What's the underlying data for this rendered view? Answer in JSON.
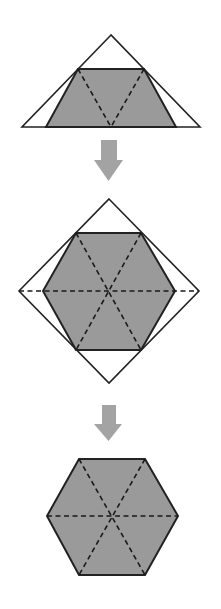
{
  "diagram": {
    "colors": {
      "background": "#ffffff",
      "stroke": "#222222",
      "shade_fill": "#9a9a9a",
      "arrow_fill": "#a3a3a3"
    },
    "steps": [
      {
        "id": "step-1",
        "outer_triangle": [
          [
            111,
            35
          ],
          [
            22,
            127
          ],
          [
            200,
            127
          ]
        ],
        "shaded_trapezoid": [
          [
            78,
            69
          ],
          [
            144,
            69
          ],
          [
            176,
            127
          ],
          [
            46,
            127
          ]
        ],
        "dashed_lines": [
          [
            [
              78,
              69
            ],
            [
              111,
              127
            ]
          ],
          [
            [
              144,
              69
            ],
            [
              111,
              127
            ]
          ]
        ]
      },
      {
        "id": "arrow-1",
        "shaft": [
          101,
          140,
          16,
          21
        ],
        "head": [
          [
            94,
            160
          ],
          [
            123,
            160
          ],
          [
            108.5,
            181
          ]
        ]
      },
      {
        "id": "step-2",
        "outer_diamond": [
          [
            109,
            199
          ],
          [
            199,
            291
          ],
          [
            109,
            383
          ],
          [
            19,
            291
          ]
        ],
        "shaded_hexagon": [
          [
            76,
            233
          ],
          [
            141,
            233
          ],
          [
            175,
            291
          ],
          [
            141,
            350
          ],
          [
            76,
            350
          ],
          [
            43,
            291
          ]
        ],
        "dashed_lines": [
          [
            [
              19,
              291
            ],
            [
              199,
              291
            ]
          ],
          [
            [
              76,
              233
            ],
            [
              141,
              350
            ]
          ],
          [
            [
              141,
              233
            ],
            [
              76,
              350
            ]
          ]
        ]
      },
      {
        "id": "arrow-2",
        "shaft": [
          102,
          405,
          14,
          20
        ],
        "head": [
          [
            94,
            424
          ],
          [
            122,
            424
          ],
          [
            108.5,
            441
          ]
        ]
      },
      {
        "id": "step-3",
        "shaded_hexagon": [
          [
            79,
            459
          ],
          [
            145,
            459
          ],
          [
            178,
            516
          ],
          [
            145,
            575
          ],
          [
            79,
            575
          ],
          [
            47,
            516
          ]
        ],
        "dashed_lines": [
          [
            [
              47,
              516
            ],
            [
              178,
              516
            ]
          ],
          [
            [
              79,
              459
            ],
            [
              145,
              575
            ]
          ],
          [
            [
              145,
              459
            ],
            [
              79,
              575
            ]
          ]
        ]
      }
    ]
  }
}
